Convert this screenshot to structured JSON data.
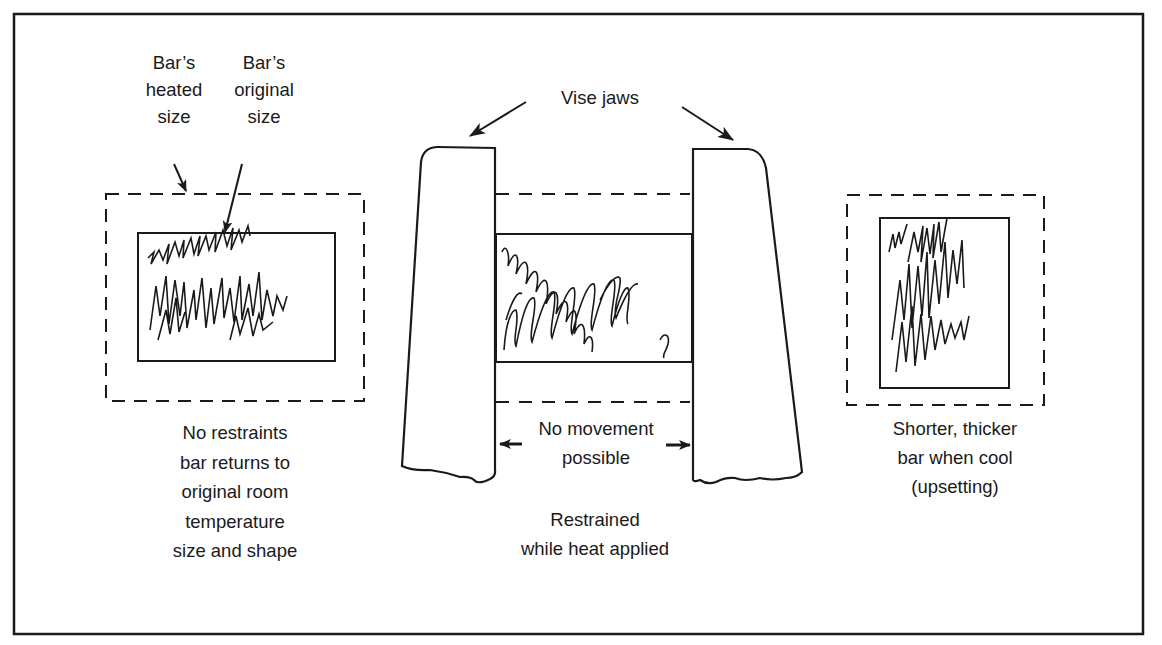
{
  "figure": {
    "ink_color": "#1a1a1a",
    "background": "#ffffff"
  },
  "left_panel": {
    "heated_label": [
      "Bar’s",
      "heated",
      "size"
    ],
    "original_label": [
      "Bar’s",
      "original",
      "size"
    ],
    "caption": [
      "No restraints",
      "bar returns to",
      "original room",
      "temperature",
      "size and shape"
    ]
  },
  "center_panel": {
    "jaws_label": "Vise jaws",
    "movement_label": [
      "No movement",
      "possible"
    ],
    "caption": [
      "Restrained",
      "while heat applied"
    ]
  },
  "right_panel": {
    "caption": [
      "Shorter, thicker",
      "bar when cool",
      "(upsetting)"
    ]
  }
}
